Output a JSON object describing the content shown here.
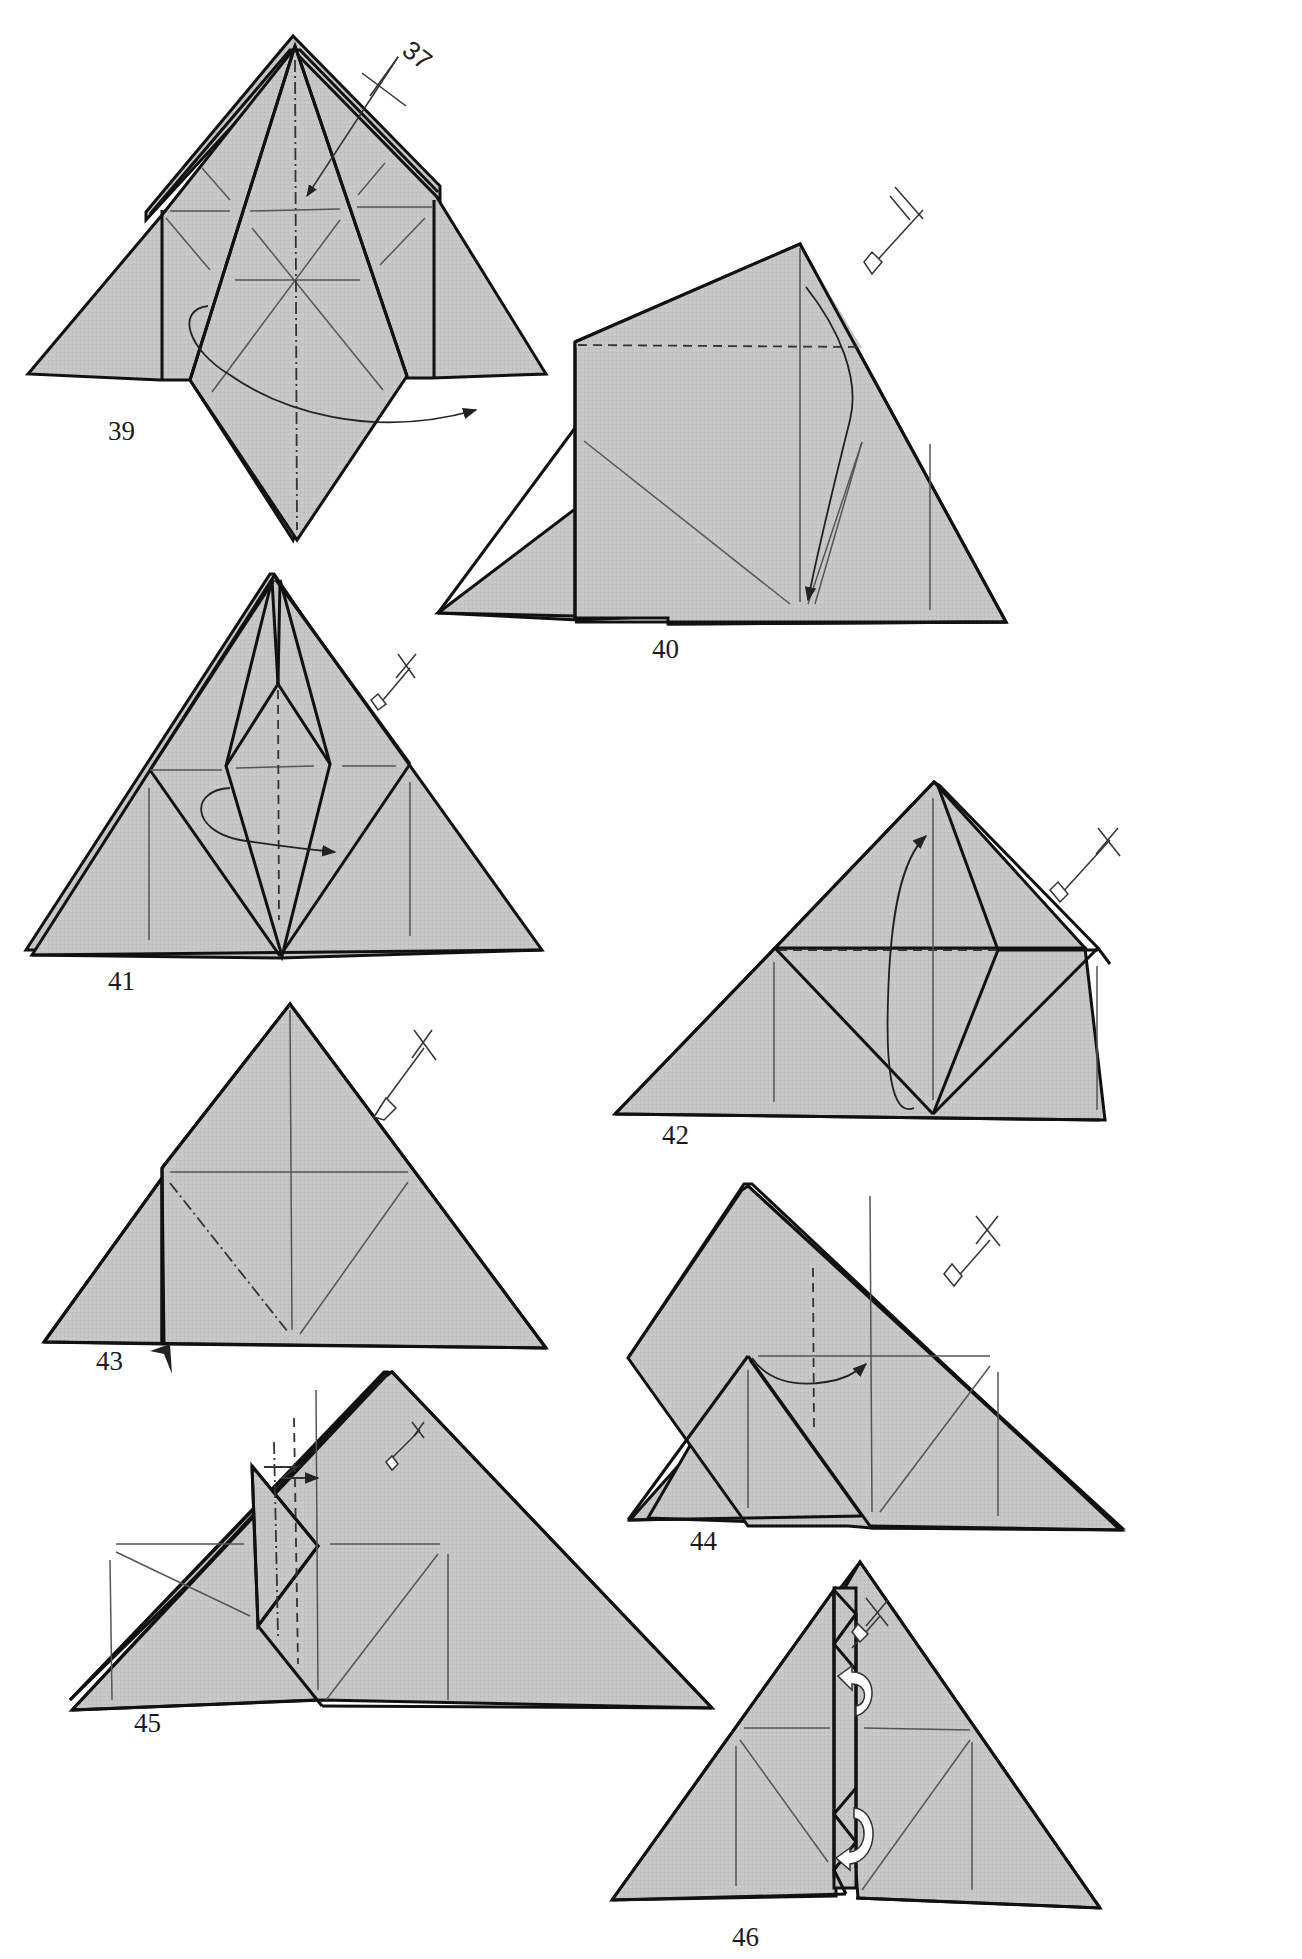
{
  "page": {
    "background": "#ffffff",
    "paper_color": "#c6c6c6",
    "line_color": "#111111"
  },
  "steps": [
    {
      "number": "39",
      "label_pos": [
        108,
        418
      ],
      "instruction": "Mountain-fold along center; reverse fold flap behind",
      "symbols": [
        "mountain-fold-line",
        "turn-arrow",
        "reference-arrow-37"
      ]
    },
    {
      "number": "40",
      "label_pos": [
        652,
        636
      ],
      "instruction": "Valley-fold top down",
      "symbols": [
        "valley-fold-line",
        "fold-arrow",
        "view-indicator"
      ]
    },
    {
      "number": "41",
      "label_pos": [
        108,
        968
      ],
      "instruction": "Valley-fold flap across",
      "symbols": [
        "valley-fold-line",
        "fold-arrow",
        "view-indicator"
      ]
    },
    {
      "number": "42",
      "label_pos": [
        662,
        1122
      ],
      "instruction": "Valley-fold flap up",
      "symbols": [
        "valley-fold-line",
        "fold-arrow",
        "view-indicator"
      ]
    },
    {
      "number": "43",
      "label_pos": [
        96,
        1348
      ],
      "instruction": "Mountain-fold edge; push in",
      "symbols": [
        "mountain-fold-line",
        "push-arrow",
        "view-indicator"
      ]
    },
    {
      "number": "44",
      "label_pos": [
        690,
        1528
      ],
      "instruction": "Valley-fold across",
      "symbols": [
        "valley-fold-line",
        "fold-arrow",
        "view-indicator"
      ]
    },
    {
      "number": "45",
      "label_pos": [
        134,
        1710
      ],
      "instruction": "Pleat fold",
      "symbols": [
        "pleat-arrow",
        "valley-fold-line",
        "mountain-fold-line",
        "view-indicator"
      ]
    },
    {
      "number": "46",
      "label_pos": [
        732,
        1924
      ],
      "instruction": "Tuck flaps behind",
      "symbols": [
        "tuck-arrow",
        "tuck-arrow",
        "view-indicator"
      ]
    }
  ],
  "reference": {
    "text": "37",
    "pos": [
      414,
      36
    ]
  }
}
